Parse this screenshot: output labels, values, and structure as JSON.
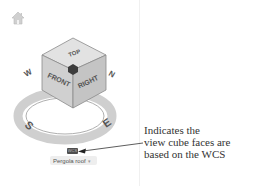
{
  "viewcube": {
    "faces": {
      "top": "TOP",
      "front": "FRONT",
      "right": "RIGHT"
    },
    "compass": {
      "west": "W",
      "north": "N",
      "south": "S",
      "east": "E"
    },
    "home_icon": "home-icon"
  },
  "wcs_badge": {
    "label": "WCS"
  },
  "view_selector": {
    "label": "Pergola roof",
    "chevron": "▾"
  },
  "callout": {
    "line1": "Indicates the",
    "line2": "view cube faces are",
    "line3": "based on the WCS"
  },
  "colors": {
    "cube_face": "#d6d6d6",
    "ring": "#c8c8c8",
    "badge": "#4f4f4f",
    "text": "#333333"
  }
}
